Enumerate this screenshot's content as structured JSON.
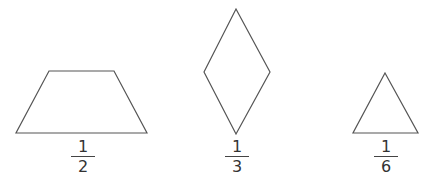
{
  "shapes": [
    {
      "id": "trapezoid",
      "points": "49,71 114,71 147,133 16,133",
      "fraction": {
        "numerator": "1",
        "denominator": "2",
        "left": 71,
        "top": 139
      }
    },
    {
      "id": "rhombus",
      "points": "236,9 270,72 236,134 204,72",
      "fraction": {
        "numerator": "1",
        "denominator": "3",
        "left": 225,
        "top": 139
      }
    },
    {
      "id": "triangle",
      "points": "385,73 418,133 353,133",
      "fraction": {
        "numerator": "1",
        "denominator": "6",
        "left": 374,
        "top": 139
      }
    }
  ],
  "style": {
    "stroke": "#555555",
    "fill": "#ffffff",
    "background": "#ffffff"
  }
}
